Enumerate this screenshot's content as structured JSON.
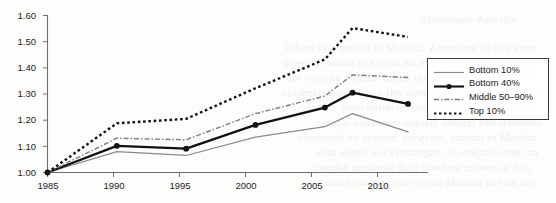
{
  "chart_data": {
    "type": "line",
    "title": "",
    "subtitle": "",
    "xlabel": "",
    "ylabel": "",
    "xlim": [
      1985,
      2011
    ],
    "ylim": [
      1.0,
      1.6
    ],
    "grid": false,
    "legend_position": "right",
    "x_ticks": [
      "1985",
      "1990",
      "1995",
      "2000",
      "2005",
      "2010"
    ],
    "x_tick_values": [
      1985,
      1990,
      1995,
      2000,
      2005,
      2010
    ],
    "y_ticks": [
      "1.00",
      "1.10",
      "1.20",
      "1.30",
      "1.40",
      "1.50",
      "1.60"
    ],
    "y_tick_values": [
      1.0,
      1.1,
      1.2,
      1.3,
      1.4,
      1.5,
      1.6
    ],
    "x": [
      1985,
      1990,
      1995,
      2000,
      2005,
      2007,
      2011
    ],
    "series": [
      {
        "name": "Bottom 10%",
        "style": "solid-thin",
        "color": "#8a8a8a",
        "markers": false,
        "values": [
          1.0,
          1.08,
          1.065,
          1.135,
          1.175,
          1.225,
          1.155
        ]
      },
      {
        "name": "Bottom 40%",
        "style": "solid-thick",
        "color": "#111111",
        "markers": true,
        "values": [
          1.0,
          1.102,
          1.091,
          1.182,
          1.248,
          1.305,
          1.262
        ]
      },
      {
        "name": "Middle 50–90%",
        "style": "dash-dot",
        "color": "#7d7d7d",
        "markers": false,
        "values": [
          1.0,
          1.131,
          1.125,
          1.225,
          1.292,
          1.373,
          1.363
        ]
      },
      {
        "name": "Top 10%",
        "style": "dotted",
        "color": "#111111",
        "markers": false,
        "values": [
          1.0,
          1.188,
          1.205,
          1.322,
          1.432,
          1.552,
          1.518
        ]
      }
    ]
  },
  "legend": {
    "items": [
      {
        "label": "Bottom 10%"
      },
      {
        "label": "Bottom 40%"
      },
      {
        "label": "Middle 50–90%"
      },
      {
        "label": "Top 10%"
      }
    ]
  },
  "axes": {
    "y_labels": [
      "1.60",
      "1.50",
      "1.40",
      "1.30",
      "1.20",
      "1.10",
      "1.00"
    ],
    "x_labels": [
      "1985",
      "1990",
      "1995",
      "2000",
      "2005",
      "2010"
    ]
  },
  "colors": {
    "axis": "#6f6f6f",
    "text": "#222222",
    "series_thin": "#8a8a8a",
    "series_thick": "#111111",
    "series_dashdot": "#7d7d7d",
    "series_dotted": "#111111",
    "legend_border": "#3a3a3a",
    "background": "#fdfdfc"
  }
}
